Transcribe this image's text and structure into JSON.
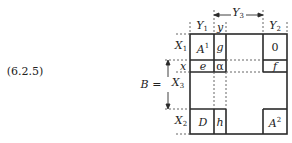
{
  "equation_label": "(6.2.5)",
  "matrix_name": "B =",
  "row_labels": [
    {
      "main": "X",
      "sub": "1"
    },
    {
      "main": "x",
      "sub": ""
    },
    {
      "main": "X",
      "sub": "3"
    },
    {
      "main": "X",
      "sub": "2"
    }
  ],
  "col_labels": [
    {
      "main": "Y",
      "sub": "1"
    },
    {
      "main": "y",
      "sub": ""
    },
    {
      "main": "Y",
      "sub": "3"
    },
    {
      "main": "Y",
      "sub": "2"
    }
  ],
  "cells": {
    "A1": {
      "main": "A",
      "sup": "1"
    },
    "g": "g",
    "zero": "0",
    "e": "e",
    "alpha": "α",
    "f": "f",
    "D": "D",
    "h": "h",
    "A2": {
      "main": "A",
      "sup": "2"
    }
  },
  "colors": {
    "line": "#2a2a2a",
    "dash": "#555555"
  }
}
